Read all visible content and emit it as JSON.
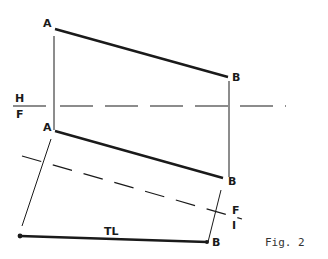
{
  "figure": {
    "caption": "Fig. 2",
    "labels": {
      "a_top": "A",
      "b_top": "B",
      "a_front": "A",
      "b_front": "B",
      "b_aux": "B",
      "true_length": "TL",
      "fold_hf_top": "H",
      "fold_hf_bottom": "F",
      "fold_f1_top": "F",
      "fold_f1_bottom": "I"
    },
    "colors": {
      "line": "#1a1a1a",
      "background": "#ffffff"
    }
  }
}
